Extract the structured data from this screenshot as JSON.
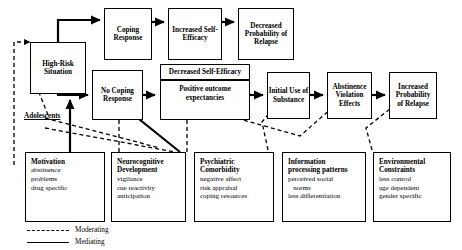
{
  "diagram": {
    "nodes": {
      "high_risk_situation": {
        "line1": "High-Risk",
        "line2": "Situation"
      },
      "coping_response": {
        "line1": "Coping",
        "line2": "Response"
      },
      "increased_self_efficacy": {
        "line1": "Increased Self-",
        "line2": "Efficacy"
      },
      "decreased_probability_relapse": {
        "line1": "Decreased",
        "line2": "Probability of",
        "line3": "Relapse"
      },
      "no_coping_response": {
        "line1": "No Coping",
        "line2": "Response"
      },
      "decreased_self_efficacy": {
        "top": "Decreased Self-Efficacy",
        "bottom_line1": "Positive outcome",
        "bottom_line2": "expectancies"
      },
      "initial_use_substance": {
        "line1": "Initial Use of",
        "line2": "Substance"
      },
      "abstinence_violation_effects": {
        "line1": "Abstinence",
        "line2": "Violation",
        "line3": "Effects"
      },
      "increased_probability_relapse": {
        "line1": "Increased",
        "line2": "Probability",
        "line3": "of Relapse"
      }
    },
    "adolescents_label": "Adolescents",
    "factors": [
      {
        "id": "motivation",
        "heading_line1": "Motivation",
        "heading_line2": "",
        "items": [
          "abstinence",
          "problems",
          "drug specific"
        ],
        "spacer": true
      },
      {
        "id": "neurocognitive-development",
        "heading_line1": "Neurocognitive",
        "heading_line2": "Development",
        "items": [
          "vigilance",
          "cue reactivity",
          "anticipation"
        ],
        "spacer": false
      },
      {
        "id": "psychiatric-comorbidity",
        "heading_line1": "Psychiatric",
        "heading_line2": "Comorbidity",
        "items": [
          "negative affect",
          "risk appraisal",
          "coping resources"
        ],
        "spacer": false
      },
      {
        "id": "information-processing-patterns",
        "heading_line1": "Information",
        "heading_line2": "processing patterns",
        "items": [
          "perceived social",
          "   norms",
          "less differentiation"
        ],
        "spacer": false
      },
      {
        "id": "environmental-constraints",
        "heading_line1": "Environmental",
        "heading_line2": "Constraints",
        "items": [
          "less control",
          "age dependent",
          "gender specific"
        ],
        "spacer": false
      }
    ],
    "legend": [
      {
        "id": "moderating",
        "style": "dashed",
        "label": "Moderating"
      },
      {
        "id": "mediating",
        "style": "solid",
        "label": "Mediating"
      }
    ],
    "colors": {
      "stroke": "#000000",
      "background": "#ffffff"
    }
  }
}
